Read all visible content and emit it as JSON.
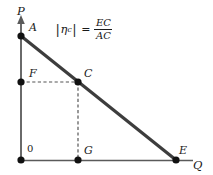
{
  "figure": {
    "width": 213,
    "height": 175,
    "background": "#ffffff",
    "line_color": "#3a3a3a",
    "axis_color": "#555555",
    "dash_color": "#555555",
    "point_color": "#111111",
    "text_color": "#1a1a1a"
  },
  "axes": {
    "vertical": {
      "label": "P",
      "name": "price-axis",
      "x": 21,
      "top": 20,
      "bottom": 160
    },
    "horizontal": {
      "label": "Q",
      "name": "quantity-axis",
      "y": 160,
      "left": 21,
      "right": 193
    },
    "origin_label": "0"
  },
  "formula": {
    "abs_open": "|",
    "abs_close": "|",
    "symbol": "η",
    "subscript": "c",
    "equals": "=",
    "numerator": "EC",
    "denominator": "AC",
    "plain": "|ηc| = EC / AC"
  },
  "points": [
    {
      "label": "A",
      "name": "point-a",
      "x": 21,
      "y": 36,
      "label_x": 29,
      "label_y": 24
    },
    {
      "label": "F",
      "name": "point-f",
      "x": 21,
      "y": 82,
      "label_x": 29,
      "label_y": 70
    },
    {
      "label": "C",
      "name": "point-c",
      "x": 78,
      "y": 82,
      "label_x": 84,
      "label_y": 70
    },
    {
      "label": "G",
      "name": "point-g",
      "x": 78,
      "y": 160,
      "label_x": 84,
      "label_y": 147
    },
    {
      "label": "E",
      "name": "point-e",
      "x": 176,
      "y": 160,
      "label_x": 180,
      "label_y": 147
    }
  ],
  "curves": {
    "demand": {
      "name": "demand-line",
      "from": "A",
      "to": "E",
      "x1": 21,
      "y1": 36,
      "x2": 176,
      "y2": 160
    },
    "dashed_horizontal": {
      "name": "dashed-line-fc",
      "from": "F",
      "to": "C",
      "x1": 21,
      "y1": 82,
      "x2": 78,
      "y2": 82
    },
    "dashed_vertical": {
      "name": "dashed-line-cg",
      "from": "C",
      "to": "G",
      "x1": 78,
      "y1": 82,
      "x2": 78,
      "y2": 160
    }
  },
  "labels": {
    "p": "P",
    "q": "Q",
    "a": "A",
    "c": "C",
    "e": "E",
    "f": "F",
    "g": "G",
    "zero": "0"
  }
}
